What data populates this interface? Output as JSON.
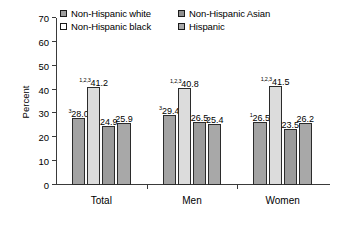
{
  "chart_data": {
    "type": "bar",
    "title": "",
    "xlabel": "",
    "ylabel": "Percent",
    "ylim": [
      0,
      70
    ],
    "yticks": [
      0,
      10,
      20,
      30,
      40,
      50,
      60,
      70
    ],
    "grid": false,
    "legend_position": "top",
    "categories": [
      "Total",
      "Men",
      "Women"
    ],
    "series": [
      {
        "name": "Non-Hispanic white",
        "swatch_color": "#9e9e9e",
        "values": [
          28.0,
          29.4,
          26.5
        ],
        "labels": [
          "28.0",
          "29.4",
          "26.5"
        ],
        "footnotes": [
          "3",
          "3",
          "1"
        ]
      },
      {
        "name": "Non-Hispanic black",
        "swatch_color": "#ffffff",
        "values": [
          41.2,
          40.8,
          41.5
        ],
        "labels": [
          "41.2",
          "40.8",
          "41.5"
        ],
        "footnotes": [
          "1,2,3",
          "1,2,3",
          "1,2,3"
        ]
      },
      {
        "name": "Non-Hispanic Asian",
        "swatch_color": "#8f8f8f",
        "values": [
          24.9,
          26.5,
          23.5
        ],
        "labels": [
          "24.9",
          "26.5",
          "23.5"
        ],
        "footnotes": [
          "",
          "",
          ""
        ]
      },
      {
        "name": "Hispanic",
        "swatch_color": "#a8a8a8",
        "values": [
          25.9,
          25.4,
          26.2
        ],
        "labels": [
          "25.9",
          "25.4",
          "26.2"
        ],
        "footnotes": [
          "",
          "",
          ""
        ]
      }
    ],
    "bar_fill_colors": [
      "#a3a3a3",
      "#dcdcdc",
      "#9b9b9b",
      "#a8a8a8"
    ],
    "bar_border_color": "#2b2b2b"
  },
  "legend": {
    "items": [
      {
        "label": "Non-Hispanic white",
        "swatch": "#9e9e9e"
      },
      {
        "label": "Non-Hispanic Asian",
        "swatch": "#8f8f8f"
      },
      {
        "label": "Non-Hispanic black",
        "swatch": "#ffffff"
      },
      {
        "label": "Hispanic",
        "swatch": "#a8a8a8"
      }
    ]
  }
}
